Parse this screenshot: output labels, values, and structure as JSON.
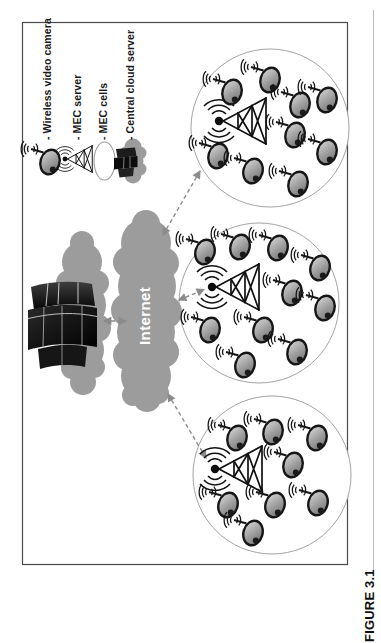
{
  "figure": {
    "caption": "FIGURE 3.1"
  },
  "legend": {
    "items": [
      {
        "icon": "wireless-video-camera-icon",
        "label": "- Wireless video camera"
      },
      {
        "icon": "mec-server-icon",
        "label": "- MEC server"
      },
      {
        "icon": "mec-cells-icon",
        "label": "- MEC cells"
      },
      {
        "icon": "central-cloud-server-icon",
        "label": "- Central cloud server"
      }
    ]
  },
  "diagram": {
    "internet_label": "Internet",
    "cells": [
      {
        "name": "MEC cell 1",
        "mec_servers": 1,
        "cameras": 9
      },
      {
        "name": "MEC cell 2",
        "mec_servers": 1,
        "cameras": 10
      },
      {
        "name": "MEC cell 3",
        "mec_servers": 1,
        "cameras": 8
      }
    ],
    "links": [
      "Central cloud server <-> Internet",
      "Internet <-> MEC cell 1",
      "Internet <-> MEC cell 2",
      "Internet <-> MEC cell 3"
    ],
    "colors": {
      "cloud_gray": "#9c9c9c",
      "arrow_gray": "#8b8b8b",
      "cell_stroke": "#a4a4a4",
      "ink": "#141414"
    }
  }
}
